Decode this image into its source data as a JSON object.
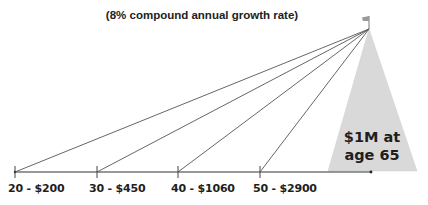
{
  "diagram": {
    "title": "(8% compound annual growth rate)",
    "goal": {
      "line1": "$1M at",
      "line2": "age 65"
    },
    "milestones": [
      {
        "age": 20,
        "amount": "$200",
        "label": "20 - $200"
      },
      {
        "age": 30,
        "amount": "$450",
        "label": "30 - $450"
      },
      {
        "age": 40,
        "amount": "$1060",
        "label": "40 - $1060"
      },
      {
        "age": 50,
        "amount": "$2900",
        "label": "50 - $2900"
      }
    ],
    "icons": {
      "summit": "flag-icon"
    },
    "colors": {
      "lines": "#444444",
      "triangle_fill": "#d9d9d9",
      "text": "#1e1e1e"
    }
  }
}
